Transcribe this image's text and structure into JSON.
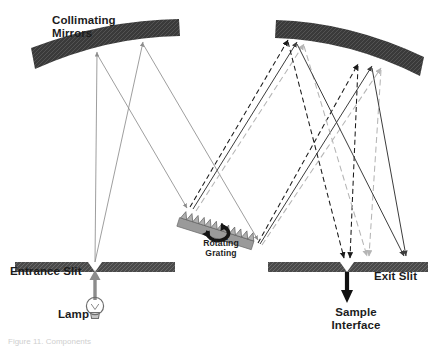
{
  "figure": {
    "caption": "Figure 11. Components",
    "background": "#ffffff"
  },
  "labels": {
    "collimating_mirrors_line1": "Collimating",
    "collimating_mirrors_line2": "Mirrors",
    "entrance_slit": "Entrance Slit",
    "exit_slit": "Exit Slit",
    "lamp": "Lamp",
    "rotating_grating_line1": "Rotating",
    "rotating_grating_line2": "Grating",
    "sample_line1": "Sample",
    "sample_line2": "Interface"
  },
  "colors": {
    "mirror_fill": "#3a3a3a",
    "slit_fill": "#4a4a4a",
    "grating_fill": "#9a9a9a",
    "grating_stroke": "#5c5c5c",
    "ray_thin_gray": "#8c8c8c",
    "ray_solid_dark": "#3c3c3c",
    "ray_dashed_black": "#1a1a1a",
    "ray_dashed_gray": "#b5b5b5",
    "arrow_black": "#111111",
    "text": "#1c1c1c"
  },
  "components": [
    {
      "name": "collimating-mirror-left",
      "type": "mirror",
      "x": 30,
      "y": 18,
      "width": 150,
      "height": 54
    },
    {
      "name": "collimating-mirror-right",
      "type": "mirror",
      "x": 275,
      "y": 18,
      "width": 150,
      "height": 57
    },
    {
      "name": "entrance-slit",
      "type": "slit",
      "x": 15,
      "y": 262,
      "width": 160,
      "gap_x": 95
    },
    {
      "name": "exit-slit",
      "type": "slit",
      "x": 268,
      "y": 262,
      "width": 160,
      "gap_x": 347
    },
    {
      "name": "rotating-grating",
      "type": "grating",
      "x": 180,
      "y": 205,
      "teeth": 12,
      "angle": -18
    },
    {
      "name": "lamp",
      "type": "light-source",
      "x": 95,
      "y": 310
    },
    {
      "name": "sample-interface",
      "type": "output-arrow",
      "x": 347,
      "y": 300
    }
  ],
  "beam_paths": {
    "entrance_to_left_mirror": [
      "divergent beam from entrance slit to collimating mirror 1"
    ],
    "left_mirror_to_grating": [
      "collimated beam directed onto rotating grating"
    ],
    "grating_to_right_mirror": [
      "dispersed orders: black dashed, gray dashed, solid"
    ],
    "right_mirror_to_exit": [
      "focused wavelengths converging at exit slit"
    ]
  },
  "ray_legend": [
    {
      "style": "thin-gray-solid",
      "meaning": "source beam"
    },
    {
      "style": "black-dashed",
      "meaning": "dispersed order A"
    },
    {
      "style": "gray-dashed",
      "meaning": "dispersed order B"
    },
    {
      "style": "dark-solid",
      "meaning": "dispersed order C"
    }
  ]
}
